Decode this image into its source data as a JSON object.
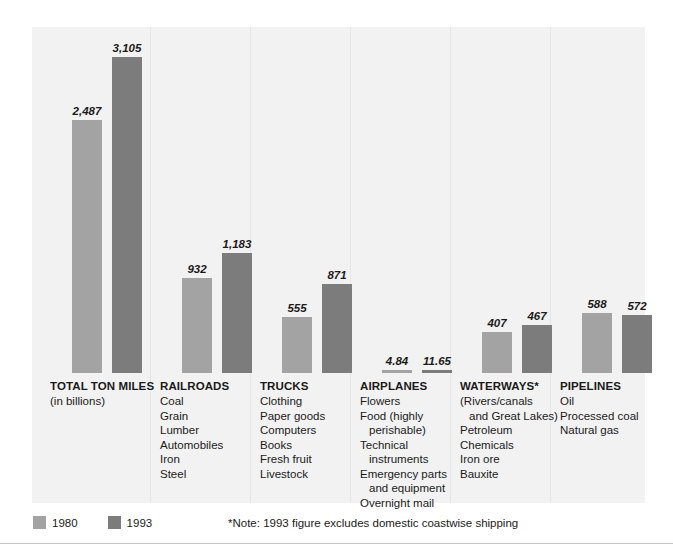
{
  "chart_data": {
    "type": "bar",
    "title": "",
    "subtitle": "",
    "xlabel": "",
    "ylabel": "Ton miles (in billions)",
    "ylim": [
      0,
      3105
    ],
    "grid": false,
    "legend_position": "bottom-left",
    "categories": [
      "TOTAL TON MILES",
      "RAILROADS",
      "TRUCKS",
      "AIRPLANES",
      "WATERWAYS*",
      "PIPELINES"
    ],
    "series": [
      {
        "name": "1980",
        "color": "#a3a3a3",
        "values": [
          2487,
          932,
          555,
          4.84,
          407,
          588
        ],
        "value_labels": [
          "2,487",
          "932",
          "555",
          "4.84",
          "407",
          "588"
        ]
      },
      {
        "name": "1993",
        "color": "#7c7c7c",
        "values": [
          3105,
          1183,
          871,
          11.65,
          467,
          572
        ],
        "value_labels": [
          "3,105",
          "1,183",
          "871",
          "11.65",
          "467",
          "572"
        ]
      }
    ],
    "annotations": [
      "*Note: 1993 figure excludes domestic coastwise shipping"
    ]
  },
  "groups": [
    {
      "title": "TOTAL TON MILES",
      "subtitle": "(in billions)",
      "items": [],
      "bars": [
        {
          "series": "1980",
          "label": "2,487",
          "value": 2487
        },
        {
          "series": "1993",
          "label": "3,105",
          "value": 3105
        }
      ]
    },
    {
      "title": "RAILROADS",
      "subtitle": "",
      "items": [
        "Coal",
        "Grain",
        "Lumber",
        "Automobiles",
        "Iron",
        "Steel"
      ],
      "bars": [
        {
          "series": "1980",
          "label": "932",
          "value": 932
        },
        {
          "series": "1993",
          "label": "1,183",
          "value": 1183
        }
      ]
    },
    {
      "title": "TRUCKS",
      "subtitle": "",
      "items": [
        "Clothing",
        "Paper goods",
        "Computers",
        "Books",
        "Fresh fruit",
        "Livestock"
      ],
      "bars": [
        {
          "series": "1980",
          "label": "555",
          "value": 555
        },
        {
          "series": "1993",
          "label": "871",
          "value": 871
        }
      ]
    },
    {
      "title": "AIRPLANES",
      "subtitle": "",
      "items": [
        "Flowers",
        "Food (highly",
        "perishable)",
        "Technical",
        "instruments",
        "Emergency parts",
        "and equipment",
        "Overnight mail"
      ],
      "bars": [
        {
          "series": "1980",
          "label": "4.84",
          "value": 4.84
        },
        {
          "series": "1993",
          "label": "11.65",
          "value": 11.65
        }
      ]
    },
    {
      "title": "WATERWAYS*",
      "subtitle": "",
      "items": [
        "(Rivers/canals",
        "and Great Lakes)",
        "Petroleum",
        "Chemicals",
        "Iron ore",
        "Bauxite"
      ],
      "bars": [
        {
          "series": "1980",
          "label": "407",
          "value": 407
        },
        {
          "series": "1993",
          "label": "467",
          "value": 467
        }
      ]
    },
    {
      "title": "PIPELINES",
      "subtitle": "",
      "items": [
        "Oil",
        "Processed coal",
        "Natural gas"
      ],
      "bars": [
        {
          "series": "1980",
          "label": "588",
          "value": 588
        },
        {
          "series": "1993",
          "label": "572",
          "value": 572
        }
      ]
    }
  ],
  "legend": {
    "items": [
      {
        "label": "1980",
        "color": "#a3a3a3"
      },
      {
        "label": "1993",
        "color": "#7c7c7c"
      }
    ]
  },
  "note": "*Note: 1993 figure excludes domestic coastwise shipping",
  "colors": {
    "panel": "#f2f2f2",
    "series_1980": "#a3a3a3",
    "series_1993": "#7c7c7c",
    "divider": "#e6e6e6",
    "rule": "#c9c9c9",
    "text": "#1a1a1a"
  }
}
